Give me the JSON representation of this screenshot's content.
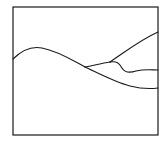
{
  "diagram": {
    "style": "hand-drawn line sketch",
    "stroke_color": "#1a1a1a",
    "background_color": "#ffffff",
    "frame": {
      "x": 13,
      "y": 7,
      "width": 145,
      "height": 128
    },
    "curves": [
      {
        "name": "main-hill-curve",
        "description": "Starts at left edge, rises to a rounded peak, descends to a fork point",
        "path": "M13,59 C22,50 32,46 42,48 C58,51 72,60 85,67"
      },
      {
        "name": "lower-branch-curve",
        "description": "From fork, continues descending and flattens to right edge",
        "path": "M85,67 C100,74 115,82 130,86 C142,89 150,89 158,88"
      },
      {
        "name": "upper-branch-curve",
        "description": "From fork, rises gently to a secondary split point",
        "path": "M85,67 C95,65 103,63 110,62"
      },
      {
        "name": "top-rising-curve",
        "description": "From secondary split, rises steadily to top-right",
        "path": "M110,62 C125,52 140,40 158,32"
      },
      {
        "name": "middle-dip-curve",
        "description": "From secondary split, dips down then levels off to right edge",
        "path": "M110,62 C117,61 119,63 122,68 C125,73 130,73 136,71 C145,69 152,70 158,70"
      }
    ],
    "labels": []
  }
}
